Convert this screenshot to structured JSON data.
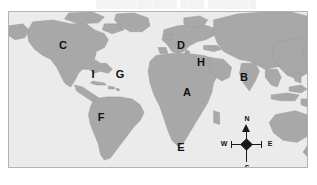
{
  "watermark": {
    "text": "██████████ ███ ████████ ███"
  },
  "map": {
    "title": "World map with lettered region labels",
    "colors": {
      "ocean": "#ebebeb",
      "land": "#a8a8a8",
      "land_outline": "#8f8f8f",
      "frame_border": "#b3b3b3",
      "label_text": "#111111",
      "page_background": "#ffffff"
    },
    "labels": [
      {
        "letter": "C",
        "x": 62,
        "y": 45,
        "region": "north-america"
      },
      {
        "letter": "D",
        "x": 180,
        "y": 45,
        "region": "europe"
      },
      {
        "letter": "H",
        "x": 200,
        "y": 62,
        "region": "middle-east"
      },
      {
        "letter": "B",
        "x": 243,
        "y": 77,
        "region": "south-asia"
      },
      {
        "letter": "I",
        "x": 92,
        "y": 74,
        "region": "caribbean"
      },
      {
        "letter": "G",
        "x": 119,
        "y": 74,
        "region": "atlantic-ocean"
      },
      {
        "letter": "A",
        "x": 186,
        "y": 92,
        "region": "africa"
      },
      {
        "letter": "F",
        "x": 100,
        "y": 117,
        "region": "south-america"
      },
      {
        "letter": "E",
        "x": 180,
        "y": 147,
        "region": "southern-africa-ocean"
      }
    ],
    "compass": {
      "north": "N",
      "south": "S",
      "east": "E",
      "west": "W"
    }
  }
}
